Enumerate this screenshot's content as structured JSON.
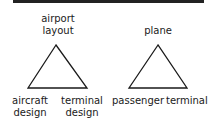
{
  "diagrams": [
    {
      "name": "airport-triangle",
      "apex": [
        "airport",
        "layout"
      ],
      "bottom_left": [
        "aircraft",
        "design"
      ],
      "bottom_right": [
        "terminal",
        "design"
      ]
    },
    {
      "name": "plane-triangle",
      "apex": [
        "plane"
      ],
      "bottom_left": [
        "passenger"
      ],
      "bottom_right": [
        "terminal"
      ]
    }
  ]
}
